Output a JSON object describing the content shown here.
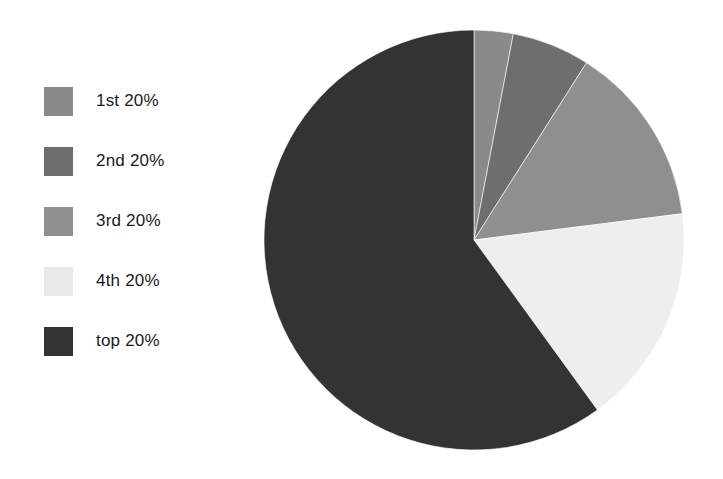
{
  "chart_data": {
    "type": "pie",
    "title": "",
    "subtitle": "",
    "xlabel": "",
    "ylabel": "",
    "grid": false,
    "legend_position": "left",
    "start_angle_deg": 0,
    "direction": "clockwise",
    "categories": [
      "1st 20%",
      "2nd 20%",
      "3rd 20%",
      "4th 20%",
      "top 20%"
    ],
    "values": [
      3,
      6,
      14,
      17,
      60
    ],
    "units": "percent",
    "slices": [
      {
        "label": "1st 20%",
        "value": 3,
        "color": "#8a8a8a",
        "start_deg": 0,
        "end_deg": 10.8
      },
      {
        "label": "2nd 20%",
        "value": 6,
        "color": "#6e6e6e",
        "start_deg": 10.8,
        "end_deg": 32.4
      },
      {
        "label": "3rd 20%",
        "value": 14,
        "color": "#8f8f8f",
        "start_deg": 32.4,
        "end_deg": 82.8
      },
      {
        "label": "4th 20%",
        "value": 17,
        "color": "#eeeeee",
        "start_deg": 82.8,
        "end_deg": 144.0
      },
      {
        "label": "top 20%",
        "value": 60,
        "color": "#333333",
        "start_deg": 144.0,
        "end_deg": 360.0
      }
    ]
  },
  "legend": {
    "items": [
      {
        "label": "1st 20%",
        "color": "#8a8a8a"
      },
      {
        "label": "2nd 20%",
        "color": "#6e6e6e"
      },
      {
        "label": "3rd 20%",
        "color": "#8f8f8f"
      },
      {
        "label": "4th 20%",
        "color": "#e9e9e9"
      },
      {
        "label": "top 20%",
        "color": "#333333"
      }
    ]
  },
  "canvas": {
    "background": "#ffffff",
    "pie_center_x": 212,
    "pie_center_y": 212,
    "pie_radius": 210
  }
}
